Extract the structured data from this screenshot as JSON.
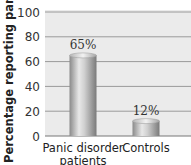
{
  "chart_data": {
    "type": "bar",
    "title": "",
    "xlabel": "",
    "ylabel": "Percentage reporting panic",
    "ylim": [
      0,
      100
    ],
    "yticks": [
      "0",
      "20",
      "40",
      "60",
      "80",
      "100"
    ],
    "ytick_values": [
      0,
      20,
      40,
      60,
      80,
      100
    ],
    "grid": true,
    "categories": [
      [
        "Panic disorder",
        "patients"
      ],
      [
        "Controls"
      ]
    ],
    "values": [
      65,
      12
    ],
    "data_labels": [
      "65%",
      "12%"
    ],
    "colors": {
      "plot_background": "#ebebeb",
      "gridline": "#9a9a9a",
      "bar_light": "#e6e6e6",
      "bar_dark": "#8c8c8c"
    }
  }
}
